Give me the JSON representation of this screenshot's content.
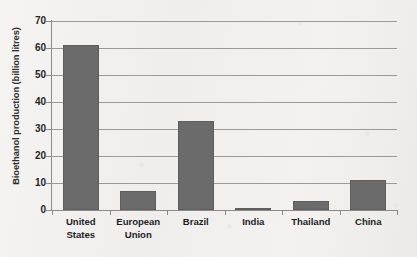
{
  "chart_data": {
    "type": "bar",
    "title": "",
    "subtitle": "",
    "xlabel": "",
    "ylabel": "Bioethanol production (billion litres)",
    "categories": [
      "United States",
      "European Union",
      "Brazil",
      "India",
      "Thailand",
      "China"
    ],
    "category_lines": [
      [
        "United",
        "States"
      ],
      [
        "European",
        "Union"
      ],
      [
        "Brazil"
      ],
      [
        "India"
      ],
      [
        "Thailand"
      ],
      [
        "China"
      ]
    ],
    "values": [
      61.2,
      7.0,
      32.8,
      0.7,
      3.3,
      11.2
    ],
    "ylim": [
      0,
      70
    ],
    "ytick_values": [
      0,
      10,
      20,
      30,
      40,
      50,
      60,
      70
    ],
    "ytick_labels": [
      "0",
      "10",
      "20",
      "30",
      "40",
      "50",
      "60",
      "70"
    ],
    "grid": true,
    "grid_axis": "y",
    "legend": false,
    "legend_position": "none",
    "annotations": [],
    "bar_color": "#6b6b6b",
    "gridline_color": "#9a9a9a",
    "axis_color": "#8b8b8b",
    "text_color": "#1f1f1f",
    "background_color": "#f2f1ef"
  }
}
